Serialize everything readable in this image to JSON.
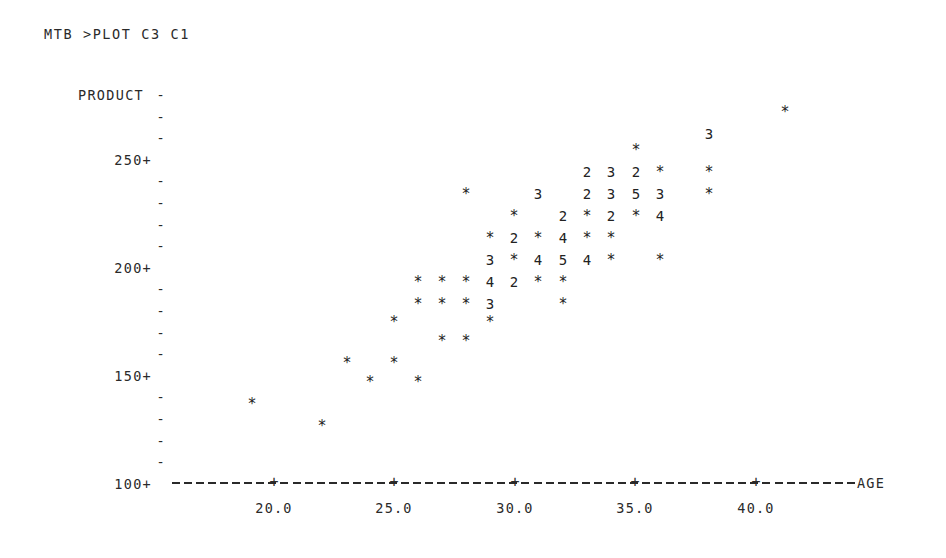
{
  "terminal": {
    "prompt_line": "MTB >PLOT C3 C1"
  },
  "chart_data": {
    "type": "scatter",
    "title": "",
    "xlabel": "AGE",
    "ylabel": "PRODUCT",
    "grid": false,
    "legend": null,
    "style": "minitab-ascii-character-plot",
    "note": "Character plot: '*' = 1 observation at that cell, digit N = N overlapping observations.",
    "xlim": [
      17.0,
      42.5
    ],
    "ylim": [
      95,
      285
    ],
    "xticks": [
      "20.0",
      "25.0",
      "30.0",
      "35.0",
      "40.0"
    ],
    "xtick_values": [
      20.0,
      25.0,
      30.0,
      35.0,
      40.0
    ],
    "yticks": [
      "250+",
      "200+",
      "150+",
      "100+"
    ],
    "ytick_values": [
      250,
      200,
      150,
      100
    ],
    "y_row_marks": [
      "-",
      "-",
      "-",
      "250+",
      "-",
      "-",
      "-",
      "-",
      "200+",
      "-",
      "-",
      "-",
      "-",
      "150+",
      "-",
      "-",
      "-",
      "-",
      "100+"
    ],
    "x_axis_dashes": "----------+----------+----------+----------+----------+--------",
    "points": [
      {
        "age": 39.4,
        "symbol": "*",
        "count": 1,
        "x": 785,
        "y": 112
      },
      {
        "age": 36.3,
        "symbol": "3",
        "count": 3,
        "x": 709,
        "y": 134
      },
      {
        "age": 33.3,
        "symbol": "*",
        "count": 1,
        "x": 636,
        "y": 150
      },
      {
        "age": 31.3,
        "symbol": "2",
        "count": 2,
        "x": 587,
        "y": 172
      },
      {
        "age": 32.3,
        "symbol": "3",
        "count": 3,
        "x": 611,
        "y": 172
      },
      {
        "age": 33.3,
        "symbol": "2",
        "count": 2,
        "x": 636,
        "y": 172
      },
      {
        "age": 34.3,
        "symbol": "*",
        "count": 1,
        "x": 660,
        "y": 172
      },
      {
        "age": 36.3,
        "symbol": "*",
        "count": 1,
        "x": 709,
        "y": 172
      },
      {
        "age": 26.3,
        "symbol": "*",
        "count": 1,
        "x": 466,
        "y": 194
      },
      {
        "age": 29.3,
        "symbol": "3",
        "count": 3,
        "x": 538,
        "y": 194
      },
      {
        "age": 31.3,
        "symbol": "2",
        "count": 2,
        "x": 587,
        "y": 194
      },
      {
        "age": 32.3,
        "symbol": "3",
        "count": 3,
        "x": 611,
        "y": 194
      },
      {
        "age": 33.3,
        "symbol": "5",
        "count": 5,
        "x": 636,
        "y": 194
      },
      {
        "age": 34.3,
        "symbol": "3",
        "count": 3,
        "x": 660,
        "y": 194
      },
      {
        "age": 36.3,
        "symbol": "*",
        "count": 1,
        "x": 709,
        "y": 194
      },
      {
        "age": 28.3,
        "symbol": "*",
        "count": 1,
        "x": 514,
        "y": 216
      },
      {
        "age": 30.3,
        "symbol": "2",
        "count": 2,
        "x": 563,
        "y": 216
      },
      {
        "age": 31.3,
        "symbol": "*",
        "count": 1,
        "x": 587,
        "y": 216
      },
      {
        "age": 32.3,
        "symbol": "2",
        "count": 2,
        "x": 611,
        "y": 216
      },
      {
        "age": 33.3,
        "symbol": "*",
        "count": 1,
        "x": 636,
        "y": 216
      },
      {
        "age": 34.3,
        "symbol": "4",
        "count": 4,
        "x": 660,
        "y": 216
      },
      {
        "age": 27.3,
        "symbol": "*",
        "count": 1,
        "x": 490,
        "y": 238
      },
      {
        "age": 28.3,
        "symbol": "2",
        "count": 2,
        "x": 514,
        "y": 238
      },
      {
        "age": 29.3,
        "symbol": "*",
        "count": 1,
        "x": 538,
        "y": 238
      },
      {
        "age": 30.3,
        "symbol": "4",
        "count": 4,
        "x": 563,
        "y": 238
      },
      {
        "age": 31.3,
        "symbol": "*",
        "count": 1,
        "x": 587,
        "y": 238
      },
      {
        "age": 32.3,
        "symbol": "*",
        "count": 1,
        "x": 611,
        "y": 238
      },
      {
        "age": 27.3,
        "symbol": "3",
        "count": 3,
        "x": 490,
        "y": 260
      },
      {
        "age": 28.3,
        "symbol": "*",
        "count": 1,
        "x": 514,
        "y": 260
      },
      {
        "age": 29.3,
        "symbol": "4",
        "count": 4,
        "x": 538,
        "y": 260
      },
      {
        "age": 30.3,
        "symbol": "5",
        "count": 5,
        "x": 563,
        "y": 260
      },
      {
        "age": 31.3,
        "symbol": "4",
        "count": 4,
        "x": 587,
        "y": 260
      },
      {
        "age": 32.3,
        "symbol": "*",
        "count": 1,
        "x": 611,
        "y": 260
      },
      {
        "age": 34.3,
        "symbol": "*",
        "count": 1,
        "x": 660,
        "y": 260
      },
      {
        "age": 24.3,
        "symbol": "*",
        "count": 1,
        "x": 418,
        "y": 282
      },
      {
        "age": 25.3,
        "symbol": "*",
        "count": 1,
        "x": 442,
        "y": 282
      },
      {
        "age": 26.3,
        "symbol": "*",
        "count": 1,
        "x": 466,
        "y": 282
      },
      {
        "age": 27.3,
        "symbol": "4",
        "count": 4,
        "x": 490,
        "y": 282
      },
      {
        "age": 28.3,
        "symbol": "2",
        "count": 2,
        "x": 514,
        "y": 282
      },
      {
        "age": 29.3,
        "symbol": "*",
        "count": 1,
        "x": 538,
        "y": 282
      },
      {
        "age": 30.3,
        "symbol": "*",
        "count": 1,
        "x": 563,
        "y": 282
      },
      {
        "age": 24.3,
        "symbol": "*",
        "count": 1,
        "x": 418,
        "y": 304
      },
      {
        "age": 25.3,
        "symbol": "*",
        "count": 1,
        "x": 442,
        "y": 304
      },
      {
        "age": 26.3,
        "symbol": "*",
        "count": 1,
        "x": 466,
        "y": 304
      },
      {
        "age": 27.3,
        "symbol": "3",
        "count": 3,
        "x": 490,
        "y": 304
      },
      {
        "age": 30.3,
        "symbol": "*",
        "count": 1,
        "x": 563,
        "y": 304
      },
      {
        "age": 21.3,
        "symbol": "*",
        "count": 1,
        "x": 394,
        "y": 322
      },
      {
        "age": 27.3,
        "symbol": "*",
        "count": 1,
        "x": 490,
        "y": 322
      },
      {
        "age": 25.3,
        "symbol": "*",
        "count": 1,
        "x": 442,
        "y": 341
      },
      {
        "age": 26.3,
        "symbol": "*",
        "count": 1,
        "x": 466,
        "y": 341
      },
      {
        "age": 24.2,
        "symbol": "*",
        "count": 1,
        "x": 347,
        "y": 363
      },
      {
        "age": 26.2,
        "symbol": "*",
        "count": 1,
        "x": 394,
        "y": 363
      },
      {
        "age": 25.2,
        "symbol": "*",
        "count": 1,
        "x": 370,
        "y": 382
      },
      {
        "age": 27.2,
        "symbol": "*",
        "count": 1,
        "x": 418,
        "y": 382
      },
      {
        "age": 20.3,
        "symbol": "*",
        "count": 1,
        "x": 252,
        "y": 404
      },
      {
        "age": 23.2,
        "symbol": "*",
        "count": 1,
        "x": 322,
        "y": 426
      }
    ]
  },
  "axis_geometry": {
    "x_axis_left": 172,
    "x_axis_right": 855,
    "x_axis_y": 483,
    "x_tick_positions": [
      274,
      394,
      515,
      635,
      756
    ],
    "y_row_top": 84,
    "y_row_height": 21.6
  }
}
